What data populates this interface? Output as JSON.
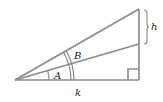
{
  "diagram": {
    "type": "right-triangle",
    "labels": {
      "angle_inner": "A",
      "angle_outer": "B",
      "opposite_segment": "h",
      "base": "k"
    },
    "colors": {
      "stroke": "#8a8a8a",
      "text": "#222222",
      "background": "#ffffff"
    }
  }
}
